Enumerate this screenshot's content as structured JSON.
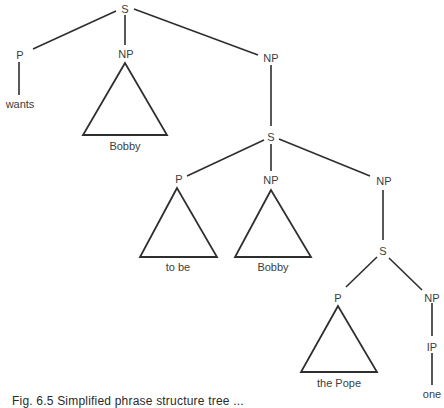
{
  "figure": {
    "caption": "Fig. 6.5  Simplified phrase structure tree ...",
    "nodes": {
      "s1": {
        "label": "S"
      },
      "p1": {
        "label": "P"
      },
      "np1": {
        "label": "NP"
      },
      "np2": {
        "label": "NP"
      },
      "s2": {
        "label": "S"
      },
      "p2": {
        "label": "P"
      },
      "np3": {
        "label": "NP"
      },
      "np4": {
        "label": "NP"
      },
      "s3": {
        "label": "S"
      },
      "p3": {
        "label": "P"
      },
      "np5": {
        "label": "NP"
      },
      "ip1": {
        "label": "IP"
      }
    },
    "leaves": {
      "wants": "wants",
      "bobby1": "Bobby",
      "tobe": "to be",
      "bobby2": "Bobby",
      "thepope": "the Pope",
      "one": "one"
    }
  }
}
